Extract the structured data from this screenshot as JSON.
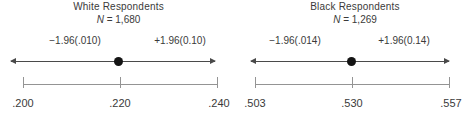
{
  "chart_data": [
    {
      "type": "scatter",
      "title": "White Respondents",
      "n_prefix": "N",
      "n_rest": " = 1,680",
      "sample_size": 1680,
      "point_estimate": 0.22,
      "interval": [
        0.2,
        0.24
      ],
      "lower_annotation": "−1.96(.010)",
      "upper_annotation": "+1.96(0.10)",
      "x_ticks": [
        0.2,
        0.22,
        0.24
      ],
      "tick_labels": [
        ".200",
        ".220",
        ".240"
      ],
      "xlim": [
        0.2,
        0.24
      ],
      "legend": "none",
      "grid": false
    },
    {
      "type": "scatter",
      "title": "Black Respondents",
      "n_prefix": "N",
      "n_rest": " = 1,269",
      "sample_size": 1269,
      "point_estimate": 0.53,
      "interval": [
        0.503,
        0.557
      ],
      "lower_annotation": "−1.96(.014)",
      "upper_annotation": "+1.96(0.14)",
      "x_ticks": [
        0.503,
        0.53,
        0.557
      ],
      "tick_labels": [
        ".503",
        ".530",
        ".557"
      ],
      "xlim": [
        0.503,
        0.557
      ],
      "legend": "none",
      "grid": false
    }
  ],
  "colors": {
    "background": "#ffffff",
    "text": "#3a3a3a",
    "interval_arrow": "#4a4a4a",
    "point_dot": "#141414",
    "axis_line": "#949494"
  }
}
